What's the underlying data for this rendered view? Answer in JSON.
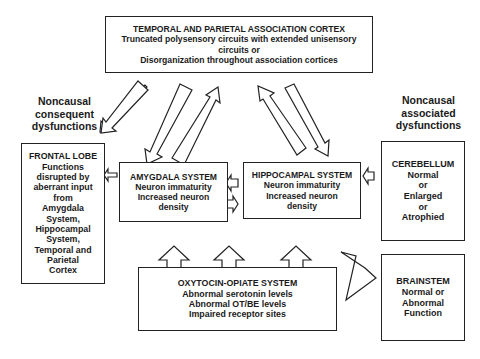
{
  "top_box": {
    "title": "TEMPORAL AND PARIETAL ASSOCIATION CORTEX",
    "line1": "Truncated polysensory circuits with extended unisensory",
    "line2": "circuits or",
    "line3": "Disorganization throughout association cortices"
  },
  "left_label": {
    "line1": "Noncausal",
    "line2": "consequent",
    "line3": "dysfunctions"
  },
  "right_label": {
    "line1": "Noncausal",
    "line2": "associated",
    "line3": "dysfunctions"
  },
  "frontal_lobe": {
    "lines": [
      "FRONTAL LOBE",
      "Functions",
      "disrupted by",
      "aberrant input",
      "from",
      "Amygdala",
      "System,",
      "Hippocampal",
      "System,",
      "Temporal and",
      "Parietal",
      "Cortex"
    ]
  },
  "amygdala": {
    "lines": [
      "AMYGDALA SYSTEM",
      "Neuron immaturity",
      "Increased neuron",
      "density"
    ]
  },
  "hippocampal": {
    "lines": [
      "HIPPOCAMPAL SYSTEM",
      "Neuron immaturity",
      "Increased neuron",
      "density"
    ]
  },
  "cerebellum": {
    "lines": [
      "CEREBELLUM",
      "Normal",
      "or",
      "Enlarged",
      "or",
      "Atrophied"
    ]
  },
  "brainstem": {
    "lines": [
      "BRAINSTEM",
      "Normal or",
      "Abnormal",
      "Function"
    ]
  },
  "oxytocin": {
    "lines": [
      "OXYTOCIN-OPIATE SYSTEM",
      "Abnormal serotonin levels",
      "Abnormal OT/BE levels",
      "Impaired receptor sites"
    ]
  }
}
